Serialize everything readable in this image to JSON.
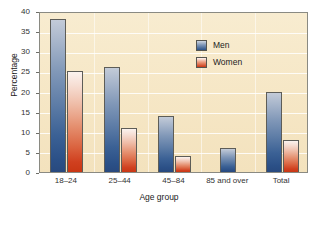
{
  "chart_data": {
    "type": "bar",
    "title": "",
    "xlabel": "Age group",
    "ylabel": "Percentage",
    "categories": [
      "18–24",
      "25–44",
      "45–84",
      "85 and over",
      "Total"
    ],
    "series": [
      {
        "name": "Men",
        "color": "#2c5288",
        "values": [
          38,
          26,
          14,
          6,
          20
        ]
      },
      {
        "name": "Women",
        "color": "#cb3a16",
        "values": [
          25,
          11,
          4,
          null,
          8
        ]
      }
    ],
    "ylim": [
      0,
      40
    ],
    "yticks": [
      0,
      5,
      10,
      15,
      20,
      25,
      30,
      35,
      40
    ],
    "ytick_labels": [
      "0",
      "5",
      "10",
      "15",
      "20",
      "25",
      "30",
      "35",
      "40"
    ],
    "grid": "horizontal",
    "legend_position": "upper-right",
    "plot_background": "#f6e7c6"
  },
  "legend": {
    "entries": [
      {
        "label": "Men",
        "swatch": "men-swatch"
      },
      {
        "label": "Women",
        "swatch": "women-swatch"
      }
    ]
  },
  "axes": {
    "y_title": "Percentage",
    "x_title": "Age group"
  }
}
